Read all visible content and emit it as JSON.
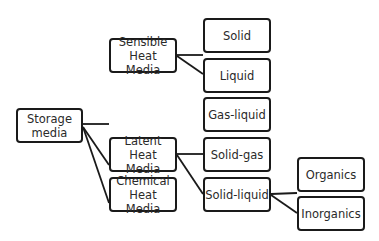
{
  "diagram": {
    "type": "tree",
    "root": "Storage media",
    "nodes": {
      "storage": {
        "label": "Storage media",
        "box": [
          16,
          108,
          67,
          35
        ]
      },
      "sensible": {
        "label": "Sensible Heat Media",
        "box": [
          109,
          38,
          68,
          35
        ]
      },
      "latent": {
        "label": "Latent Heat Media",
        "box": [
          109,
          137,
          68,
          35
        ]
      },
      "chemical": {
        "label": "Chemical Heat Media",
        "box": [
          109,
          177,
          68,
          35
        ]
      },
      "solid": {
        "label": "Solid",
        "box": [
          203,
          18,
          68,
          35
        ]
      },
      "liquid": {
        "label": "Liquid",
        "box": [
          203,
          58,
          68,
          35
        ]
      },
      "gas_liquid": {
        "label": "Gas-liquid",
        "box": [
          203,
          97,
          68,
          35
        ]
      },
      "solid_gas": {
        "label": "Solid-gas",
        "box": [
          203,
          137,
          68,
          35
        ]
      },
      "solid_liquid": {
        "label": "Solid-liquid",
        "box": [
          203,
          177,
          68,
          35
        ]
      },
      "organics": {
        "label": "Organics",
        "box": [
          297,
          157,
          68,
          35
        ]
      },
      "inorganics": {
        "label": "Inorganics",
        "box": [
          297,
          196,
          68,
          35
        ]
      }
    },
    "edges": [
      [
        "Storage media",
        "Sensible Heat Media"
      ],
      [
        "Storage media",
        "Latent Heat Media"
      ],
      [
        "Storage media",
        "Chemical Heat Media"
      ],
      [
        "Sensible Heat Media",
        "Solid"
      ],
      [
        "Sensible Heat Media",
        "Liquid"
      ],
      [
        "Latent Heat Media",
        "Gas-liquid"
      ],
      [
        "Latent Heat Media",
        "Solid-gas"
      ],
      [
        "Latent Heat Media",
        "Solid-liquid"
      ],
      [
        "Solid-liquid",
        "Organics"
      ],
      [
        "Solid-liquid",
        "Inorganics"
      ]
    ],
    "colors": {
      "stroke": "#1a1a1a",
      "text": "#2a2a2a",
      "background": "#ffffff"
    }
  }
}
